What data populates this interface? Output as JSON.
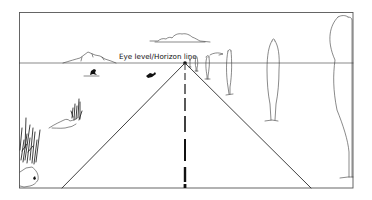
{
  "figure": {
    "type": "one-point perspective illustration",
    "label": "Eye level/Horizon line",
    "colors": {
      "background": "#ffffff",
      "ink": "#2a2a2a",
      "frame": "#555555"
    },
    "frame": {
      "x": 19,
      "y": 12,
      "width": 334,
      "height": 176
    },
    "horizon_y": 63,
    "vanishing_point": {
      "x": 185,
      "y": 63
    },
    "road": {
      "left_edge_bottom_x": 62,
      "right_edge_bottom_x": 311,
      "center_line": "dashed, widening toward viewer"
    },
    "elements": [
      "mountain (left, on horizon)",
      "cloud (center top)",
      "two birds/figures below horizon (left)",
      "shrub clump (left middle)",
      "tall grass with rock (lower left)",
      "row of poplar trees diminishing toward vanishing point (right)"
    ]
  }
}
